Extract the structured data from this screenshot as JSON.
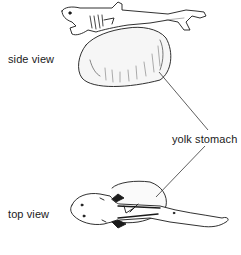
{
  "figure": {
    "labels": {
      "side_view": "side view",
      "top_view": "top view",
      "yolk_stomach": "yolk stomach"
    },
    "colors": {
      "ink": "#1a1a1a",
      "background": "#ffffff",
      "shading": "#8a8a8a"
    }
  }
}
